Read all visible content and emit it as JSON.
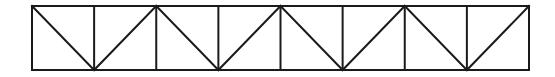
{
  "diagram": {
    "type": "truss",
    "panels": 8,
    "x_left": 32,
    "x_right": 529,
    "y_top": 6,
    "y_bottom": 70,
    "diagonals": [
      "down",
      "up",
      "down",
      "up",
      "down",
      "up",
      "down",
      "up"
    ],
    "stroke_color": "#1a1a1a",
    "stroke_width": 2,
    "background": "#ffffff"
  }
}
